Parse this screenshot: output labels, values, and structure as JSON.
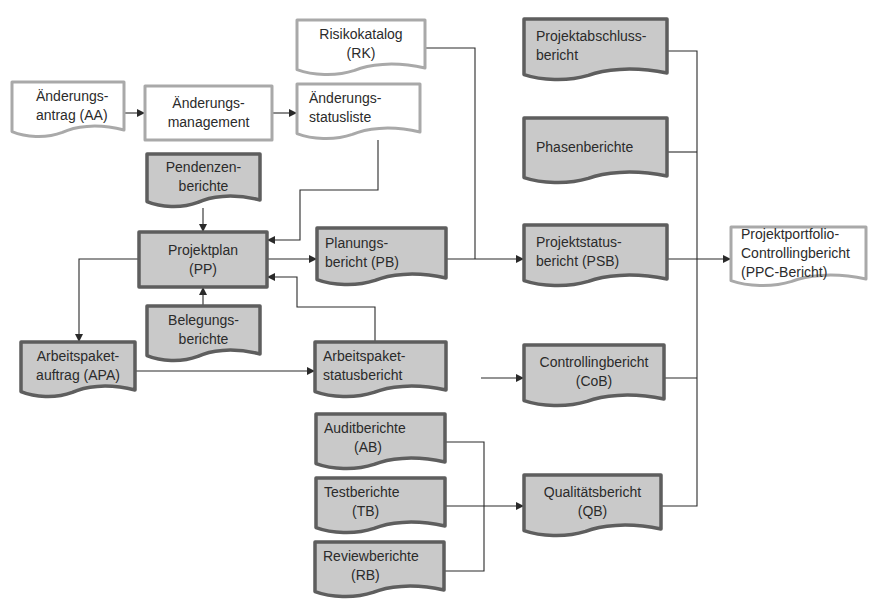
{
  "diagram": {
    "colors": {
      "filled_fill": "#c9c9c9",
      "filled_stroke": "#5e5e5e",
      "plain_fill": "#ffffff",
      "plain_stroke": "#a9a9a9",
      "edge": "#2a2a2a",
      "text": "#2b2b2b"
    },
    "nodes": [
      {
        "id": "AA",
        "shape": "doc",
        "style": "plain",
        "x": 12,
        "y": 82,
        "w": 112,
        "h": 56,
        "lines": [
          "Änderungs-",
          "antrag (AA)"
        ],
        "tx": 24,
        "anchor": "start"
      },
      {
        "id": "AM",
        "shape": "rect",
        "style": "plain",
        "x": 145,
        "y": 86,
        "w": 127,
        "h": 54,
        "lines": [
          "Änderungs-",
          "management"
        ],
        "tx": 0,
        "anchor": "middle"
      },
      {
        "id": "ASL",
        "shape": "doc",
        "style": "plain",
        "x": 297,
        "y": 84,
        "w": 123,
        "h": 56,
        "lines": [
          "Änderungs-",
          "statusliste"
        ],
        "tx": 12,
        "anchor": "start"
      },
      {
        "id": "RK",
        "shape": "doc",
        "style": "plain",
        "x": 297,
        "y": 20,
        "w": 128,
        "h": 56,
        "lines": [
          "Risikokatalog",
          "(RK)"
        ],
        "tx": 0,
        "anchor": "middle"
      },
      {
        "id": "PEN",
        "shape": "doc",
        "style": "filled",
        "x": 147,
        "y": 154,
        "w": 113,
        "h": 54,
        "lines": [
          "Pendenzen-",
          "berichte"
        ],
        "tx": 0,
        "anchor": "middle"
      },
      {
        "id": "PP",
        "shape": "rect",
        "style": "filled",
        "x": 139,
        "y": 232,
        "w": 128,
        "h": 55,
        "lines": [
          "Projektplan",
          "(PP)"
        ],
        "tx": 0,
        "anchor": "middle"
      },
      {
        "id": "BEL",
        "shape": "doc",
        "style": "filled",
        "x": 147,
        "y": 306,
        "w": 113,
        "h": 56,
        "lines": [
          "Belegungs-",
          "berichte"
        ],
        "tx": 0,
        "anchor": "middle"
      },
      {
        "id": "PB",
        "shape": "doc",
        "style": "filled",
        "x": 317,
        "y": 228,
        "w": 129,
        "h": 58,
        "lines": [
          "Planungs-",
          "bericht (PB)"
        ],
        "tx": 8,
        "anchor": "start"
      },
      {
        "id": "APA",
        "shape": "doc",
        "style": "filled",
        "x": 21,
        "y": 342,
        "w": 114,
        "h": 56,
        "lines": [
          "Arbeitspaket-",
          "auftrag (APA)"
        ],
        "tx": 0,
        "anchor": "middle"
      },
      {
        "id": "APS",
        "shape": "doc",
        "style": "filled",
        "x": 315,
        "y": 342,
        "w": 131,
        "h": 56,
        "lines": [
          "Arbeitspaket-",
          "statusbericht"
        ],
        "tx": 8,
        "anchor": "start"
      },
      {
        "id": "AB",
        "shape": "doc",
        "style": "filled",
        "x": 316,
        "y": 414,
        "w": 129,
        "h": 56,
        "lines": [
          "Auditberichte",
          "(AB)"
        ],
        "tx": 8,
        "anchor": "start",
        "t2x": 30
      },
      {
        "id": "TB",
        "shape": "doc",
        "style": "filled",
        "x": 316,
        "y": 478,
        "w": 129,
        "h": 56,
        "lines": [
          "Testberichte",
          "(TB)"
        ],
        "tx": 8,
        "anchor": "start",
        "t2x": 28
      },
      {
        "id": "RB",
        "shape": "doc",
        "style": "filled",
        "x": 315,
        "y": 542,
        "w": 129,
        "h": 56,
        "lines": [
          "Reviewberichte",
          "(RB)"
        ],
        "tx": 8,
        "anchor": "start",
        "t2x": 28
      },
      {
        "id": "PAB",
        "shape": "doc",
        "style": "filled",
        "x": 524,
        "y": 19,
        "w": 143,
        "h": 62,
        "lines": [
          "Projektabschluss-",
          "bericht"
        ],
        "tx": 12,
        "anchor": "start"
      },
      {
        "id": "PHB",
        "shape": "doc",
        "style": "filled",
        "x": 524,
        "y": 118,
        "w": 143,
        "h": 66,
        "lines": [
          "Phasenberichte"
        ],
        "tx": 12,
        "anchor": "start"
      },
      {
        "id": "PSB",
        "shape": "doc",
        "style": "filled",
        "x": 524,
        "y": 225,
        "w": 143,
        "h": 62,
        "lines": [
          "Projektstatus-",
          "bericht (PSB)"
        ],
        "tx": 12,
        "anchor": "start"
      },
      {
        "id": "CoB",
        "shape": "doc",
        "style": "filled",
        "x": 524,
        "y": 345,
        "w": 140,
        "h": 62,
        "lines": [
          "Controllingbericht",
          "(CoB)"
        ],
        "tx": 0,
        "anchor": "middle"
      },
      {
        "id": "QB",
        "shape": "doc",
        "style": "filled",
        "x": 524,
        "y": 475,
        "w": 137,
        "h": 62,
        "lines": [
          "Qualitätsbericht",
          "(QB)"
        ],
        "tx": 0,
        "anchor": "middle"
      },
      {
        "id": "PPC",
        "shape": "doc",
        "style": "plain",
        "x": 731,
        "y": 227,
        "w": 135,
        "h": 60,
        "lines": [
          "Projektportfolio-",
          "Controllingbericht",
          "(PPC-Bericht)"
        ],
        "tx": 10,
        "anchor": "start"
      }
    ],
    "edges": [
      {
        "id": "AA-AM",
        "points": [
          [
            124,
            113
          ],
          [
            144,
            113
          ]
        ],
        "arrow": true
      },
      {
        "id": "AM-ASL",
        "points": [
          [
            272,
            113
          ],
          [
            296,
            113
          ]
        ],
        "arrow": true
      },
      {
        "id": "ASL-PP",
        "points": [
          [
            378,
            140
          ],
          [
            378,
            190
          ],
          [
            300,
            190
          ],
          [
            300,
            240
          ],
          [
            268,
            240
          ]
        ],
        "arrow": true
      },
      {
        "id": "PEN-PP",
        "points": [
          [
            203,
            208
          ],
          [
            203,
            231
          ]
        ],
        "arrow": true
      },
      {
        "id": "BEL-PP",
        "points": [
          [
            203,
            306
          ],
          [
            203,
            288
          ]
        ],
        "arrow": true
      },
      {
        "id": "PP-PB",
        "points": [
          [
            267,
            259
          ],
          [
            316,
            259
          ]
        ],
        "arrow": true
      },
      {
        "id": "PP-APA",
        "points": [
          [
            139,
            259
          ],
          [
            79,
            259
          ],
          [
            79,
            341
          ]
        ],
        "arrow": true
      },
      {
        "id": "APA-APS",
        "points": [
          [
            135,
            371
          ],
          [
            314,
            371
          ]
        ],
        "arrow": true
      },
      {
        "id": "APS-PP",
        "points": [
          [
            375,
            342
          ],
          [
            375,
            307
          ],
          [
            297,
            307
          ],
          [
            297,
            277
          ],
          [
            268,
            277
          ]
        ],
        "arrow": true
      },
      {
        "id": "RK-PSB",
        "points": [
          [
            425,
            48
          ],
          [
            475,
            48
          ],
          [
            475,
            259
          ]
        ],
        "arrow": false
      },
      {
        "id": "PB-PSB",
        "points": [
          [
            446,
            259
          ],
          [
            523,
            259
          ]
        ],
        "arrow": true
      },
      {
        "id": "IN-CoB",
        "points": [
          [
            481,
            378
          ],
          [
            523,
            378
          ]
        ],
        "arrow": true
      },
      {
        "id": "AB-join",
        "points": [
          [
            445,
            442
          ],
          [
            484,
            442
          ],
          [
            484,
            571
          ],
          [
            444,
            571
          ]
        ],
        "arrow": false
      },
      {
        "id": "TB-QB",
        "points": [
          [
            445,
            506
          ],
          [
            523,
            506
          ]
        ],
        "arrow": true
      },
      {
        "id": "PAB-bus",
        "points": [
          [
            667,
            51
          ],
          [
            697,
            51
          ],
          [
            697,
            506
          ],
          [
            661,
            506
          ]
        ],
        "arrow": false
      },
      {
        "id": "PHB-bus",
        "points": [
          [
            667,
            152
          ],
          [
            697,
            152
          ]
        ],
        "arrow": false
      },
      {
        "id": "CoB-bus",
        "points": [
          [
            664,
            378
          ],
          [
            697,
            378
          ]
        ],
        "arrow": false
      },
      {
        "id": "PSB-PPC",
        "points": [
          [
            667,
            259
          ],
          [
            730,
            259
          ]
        ],
        "arrow": true
      }
    ]
  }
}
